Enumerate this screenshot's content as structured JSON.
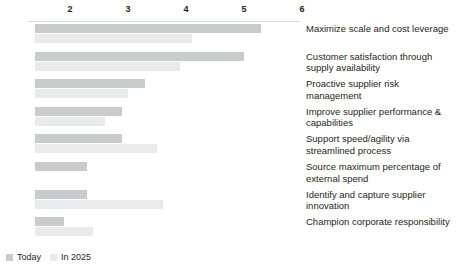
{
  "chart_data": {
    "type": "bar",
    "orientation": "horizontal",
    "title": "",
    "subtitle": "",
    "xlabel": "",
    "ylabel": "",
    "xlim": [
      1,
      6.4
    ],
    "grid": false,
    "legend_position": "bottom-left",
    "tick_labels": [
      "2",
      "3",
      "4",
      "5",
      "6"
    ],
    "ticks": [
      2,
      3,
      4,
      5,
      6
    ],
    "categories": [
      "Maximize scale and cost leverage",
      "Customer satisfaction through supply availability",
      "Proactive supplier risk management",
      "Improve supplier performance & capabilities",
      "Support speed/agility via streamlined process",
      "Source maximum percentage of external spend",
      "Identify and capture supplier innovation",
      "Champion corporate responsibility"
    ],
    "series": [
      {
        "name": "Today",
        "color": "#c9cccd",
        "values": [
          5.3,
          5.0,
          3.3,
          2.9,
          2.9,
          2.3,
          2.3,
          1.9
        ]
      },
      {
        "name": "In 2025",
        "color": "#e8eaeb",
        "values": [
          4.1,
          3.9,
          3.0,
          2.6,
          3.5,
          1.1,
          3.6,
          2.4
        ]
      }
    ]
  },
  "legend": {
    "items": [
      {
        "label": "Today",
        "swatch": "today-swatch"
      },
      {
        "label": "In 2025",
        "swatch": "in-2025-swatch"
      }
    ]
  }
}
